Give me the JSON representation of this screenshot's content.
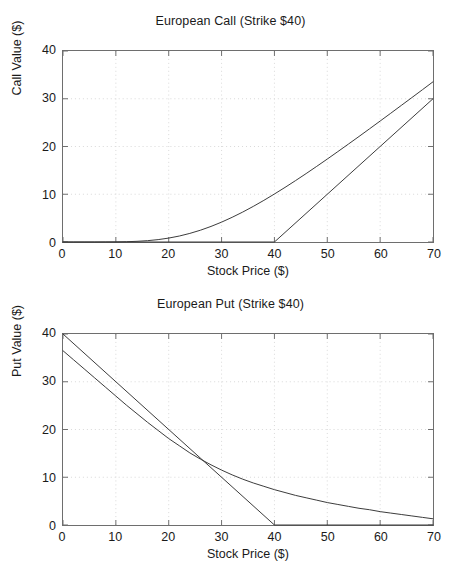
{
  "figure": {
    "background_color": "#ffffff",
    "line_color": "#3a3a3a",
    "axis_color": "#6e6e6e",
    "grid_color": "#d9d9d9"
  },
  "chart_data": [
    {
      "type": "line",
      "id": "european-call",
      "title": "European Call (Strike $40)",
      "xlabel": "Stock Price ($)",
      "ylabel": "Call Value ($)",
      "xlim": [
        0,
        70
      ],
      "ylim": [
        0,
        40
      ],
      "xticks": [
        0,
        10,
        20,
        30,
        40,
        50,
        60,
        70
      ],
      "yticks": [
        0,
        10,
        20,
        30,
        40
      ],
      "grid": true,
      "legend": "none",
      "strike": 40,
      "series": [
        {
          "name": "Black-Scholes Call Value",
          "x": [
            0,
            2,
            4,
            6,
            8,
            10,
            12,
            14,
            16,
            18,
            20,
            22,
            24,
            26,
            28,
            30,
            32,
            34,
            36,
            38,
            40,
            42,
            44,
            46,
            48,
            50,
            52,
            54,
            56,
            58,
            60,
            62,
            64,
            66,
            68,
            70
          ],
          "values": [
            0,
            0,
            0,
            0,
            0.01,
            0.02,
            0.06,
            0.14,
            0.28,
            0.5,
            0.82,
            1.25,
            1.8,
            2.47,
            3.26,
            4.16,
            5.17,
            6.27,
            7.46,
            8.72,
            10.05,
            11.43,
            12.86,
            14.33,
            15.84,
            17.37,
            18.93,
            20.51,
            22.1,
            23.71,
            25.33,
            26.96,
            28.6,
            30.24,
            31.89,
            33.55
          ]
        },
        {
          "name": "Payoff at Expiry",
          "x": [
            0,
            40,
            70
          ],
          "values": [
            0,
            0,
            30
          ]
        }
      ]
    },
    {
      "type": "line",
      "id": "european-put",
      "title": "European Put (Strike $40)",
      "xlabel": "Stock Price ($)",
      "ylabel": "Put Value ($)",
      "xlim": [
        0,
        70
      ],
      "ylim": [
        0,
        40
      ],
      "xticks": [
        0,
        10,
        20,
        30,
        40,
        50,
        60,
        70
      ],
      "yticks": [
        0,
        10,
        20,
        30,
        40
      ],
      "grid": true,
      "legend": "none",
      "strike": 40,
      "series": [
        {
          "name": "Payoff at Expiry",
          "x": [
            0,
            40,
            70
          ],
          "values": [
            40,
            0,
            0
          ]
        },
        {
          "name": "Black-Scholes Put Value",
          "x": [
            0,
            2,
            4,
            6,
            8,
            10,
            12,
            14,
            16,
            18,
            20,
            22,
            24,
            26,
            28,
            30,
            32,
            34,
            36,
            38,
            40,
            42,
            44,
            46,
            48,
            50,
            52,
            54,
            56,
            58,
            60,
            62,
            64,
            66,
            68,
            70
          ],
          "values": [
            36.5,
            34.6,
            32.7,
            30.8,
            28.9,
            27.0,
            25.1,
            23.3,
            21.5,
            19.8,
            18.1,
            16.6,
            15.1,
            13.8,
            12.6,
            11.5,
            10.5,
            9.6,
            8.8,
            8.1,
            7.4,
            6.8,
            6.2,
            5.7,
            5.2,
            4.7,
            4.3,
            3.9,
            3.5,
            3.2,
            2.8,
            2.5,
            2.2,
            1.9,
            1.6,
            1.3
          ]
        }
      ]
    }
  ],
  "panels": {
    "call": {
      "title": "European Call (Strike $40)",
      "xlabel": "Stock Price ($)",
      "ylabel": "Call Value ($)",
      "xticks": [
        "0",
        "10",
        "20",
        "30",
        "40",
        "50",
        "60",
        "70"
      ],
      "yticks": [
        "40",
        "30",
        "20",
        "10",
        "0"
      ]
    },
    "put": {
      "title": "European Put (Strike $40)",
      "xlabel": "Stock Price ($)",
      "ylabel": "Put Value ($)",
      "xticks": [
        "0",
        "10",
        "20",
        "30",
        "40",
        "50",
        "60",
        "70"
      ],
      "yticks": [
        "40",
        "30",
        "20",
        "10",
        "0"
      ]
    }
  }
}
